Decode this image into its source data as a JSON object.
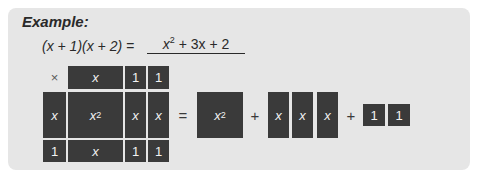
{
  "heading": "Example:",
  "equation": {
    "left": "(x + 1)(x + 2) =",
    "answer_base": "x",
    "answer_exp": "2",
    "answer_rest": " + 3x + 2"
  },
  "grid": {
    "corner": "×",
    "column_headers": [
      "x",
      "1",
      "1"
    ],
    "rows": [
      {
        "header": "x",
        "cells": [
          "x",
          "x",
          "x"
        ],
        "first_cell_exp": "2"
      },
      {
        "header": "1",
        "cells": [
          "x",
          "1",
          "1"
        ]
      }
    ]
  },
  "decomposition": {
    "equals": "=",
    "square_base": "x",
    "square_exp": "2",
    "plus_1": "+",
    "x_tiles": [
      "x",
      "x",
      "x"
    ],
    "plus_2": "+",
    "unit_tiles": [
      "1",
      "1"
    ]
  },
  "colors": {
    "tile": "#3a3a3a",
    "card": "#e6e6e6",
    "tile_text": "#f2f2f2"
  }
}
